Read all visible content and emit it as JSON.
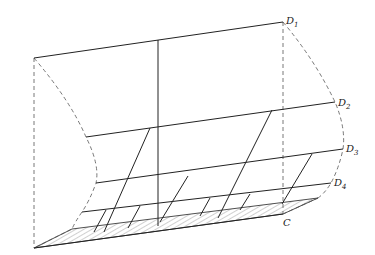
{
  "diagram": {
    "type": "perspective-geometric-figure",
    "labels": [
      {
        "id": "D1",
        "letter": "D",
        "subscript": "1",
        "x": 286,
        "y": 24
      },
      {
        "id": "D2",
        "letter": "D",
        "subscript": "2",
        "x": 338,
        "y": 106
      },
      {
        "id": "D3",
        "letter": "D",
        "subscript": "3",
        "x": 346,
        "y": 152
      },
      {
        "id": "D4",
        "letter": "D",
        "subscript": "4",
        "x": 334,
        "y": 186
      },
      {
        "id": "C",
        "letter": "C",
        "subscript": "",
        "x": 285,
        "y": 224
      }
    ],
    "colors": {
      "line": "#222222",
      "dashed": "#555555",
      "background": "#ffffff"
    }
  }
}
